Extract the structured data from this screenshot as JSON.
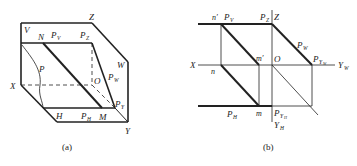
{
  "figure_a": {
    "caption": "(a)",
    "labels": {
      "V": "V",
      "N": "N",
      "PV": "P",
      "PV_sub": "V",
      "PZ": "P",
      "PZ_sub": "Z",
      "Z": "Z",
      "W": "W",
      "P": "P",
      "O": "O",
      "PW": "P",
      "PW_sub": "W",
      "X": "X",
      "PY": "P",
      "PY_sub": "Y",
      "H": "H",
      "PH": "P",
      "PH_sub": "H",
      "M": "M",
      "Y": "Y"
    }
  },
  "figure_b": {
    "caption": "(b)",
    "labels": {
      "n_prime": "n′",
      "PV": "P",
      "PV_sub": "V",
      "PZ": "P",
      "PZ_sub": "Z",
      "Z": "Z",
      "PW": "P",
      "PW_sub": "W",
      "m_prime": "m′",
      "X": "X",
      "n": "n",
      "O": "O",
      "PYW": "P",
      "PYW_sub": "Y",
      "PYW_subsub": "W",
      "YW": "Y",
      "YW_sub": "W",
      "PH": "P",
      "PH_sub": "H",
      "m": "m",
      "PYH": "P",
      "PYH_sub": "Y",
      "PYH_subsub": "H",
      "YH": "Y",
      "YH_sub": "H"
    }
  },
  "colors": {
    "line": "#222222",
    "background": "#ffffff"
  }
}
